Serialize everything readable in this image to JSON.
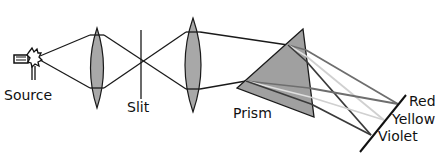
{
  "diagram": {
    "labels": {
      "source": "Source",
      "slit": "Slit",
      "prism": "Prism",
      "red": "Red",
      "yellow": "Yellow",
      "violet": "Violet"
    },
    "components": [
      {
        "name": "source",
        "type": "light-bulb"
      },
      {
        "name": "lens-1",
        "type": "convex-lens"
      },
      {
        "name": "slit",
        "type": "slit"
      },
      {
        "name": "lens-2",
        "type": "convex-lens"
      },
      {
        "name": "prism",
        "type": "triangular-prism"
      },
      {
        "name": "screen",
        "type": "screen-line"
      }
    ],
    "spectrum_order": [
      "Red",
      "Yellow",
      "Violet"
    ],
    "colors": {
      "lens_fill": "#a8a8a8",
      "prism_fill": "#a0a0a0",
      "line": "#1a1a1a",
      "ray_red": "#6e6e6e",
      "ray_yellow": "#d0d0d0",
      "ray_violet": "#3a3a3a"
    }
  }
}
